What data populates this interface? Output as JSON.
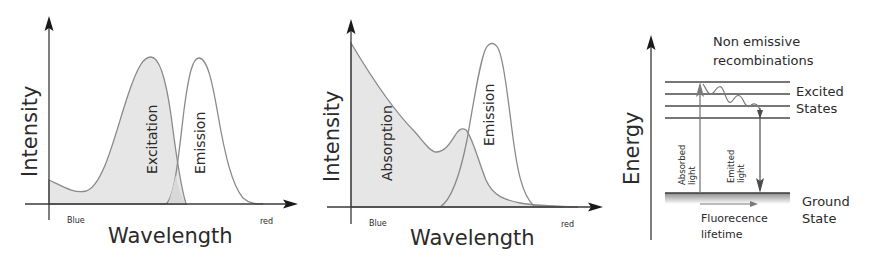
{
  "panels": {
    "excitation_emission": {
      "y_label": "Intensity",
      "x_label": "Wavelength",
      "x_start_label": "Blue",
      "x_end_label": "red",
      "curves": [
        {
          "name": "Excitation",
          "fill": "#e6e6e6"
        },
        {
          "name": "Emission",
          "fill": "#ffffff"
        }
      ]
    },
    "absorption_emission": {
      "y_label": "Intensity",
      "x_label": "Wavelength",
      "x_start_label": "Blue",
      "x_end_label": "red",
      "curves": [
        {
          "name": "Absorption",
          "fill": "#e6e6e6"
        },
        {
          "name": "Emission",
          "fill": "#ffffff"
        }
      ]
    },
    "jablonski": {
      "y_label": "Energy",
      "title_line1": "Non emissive",
      "title_line2": "recombinations",
      "excited_line1": "Excited",
      "excited_line2": "States",
      "ground_line1": "Ground",
      "ground_line2": "State",
      "absorbed_line1": "Absorbed",
      "absorbed_line2": "light",
      "emitted_line1": "Emitted",
      "emitted_line2": "light",
      "lifetime_line1": "Fluorecence",
      "lifetime_line2": "lifetime",
      "excited_levels": 4
    }
  },
  "colors": {
    "axis": "#3a3a3a",
    "curve_stroke": "#8a8a8a",
    "shade": "#e6e6e6",
    "text": "#2a2a2a"
  }
}
